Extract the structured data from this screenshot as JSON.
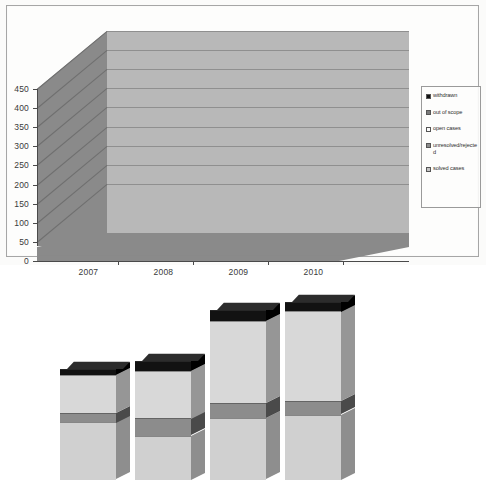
{
  "chart_data": {
    "type": "bar",
    "subtype": "stacked-3d-column",
    "title": "",
    "xlabel": "",
    "ylabel": "",
    "categories": [
      "2007",
      "2008",
      "2009",
      "2010"
    ],
    "ylim": [
      0,
      450
    ],
    "yticks": [
      0,
      50,
      100,
      150,
      200,
      250,
      300,
      350,
      400,
      450
    ],
    "ytick_labels": [
      "0",
      "50",
      "100",
      "150",
      "200",
      "250",
      "300",
      "350",
      "400",
      "450"
    ],
    "grid": true,
    "legend_position": "right",
    "series": [
      {
        "name": "solved cases",
        "color": "#d0d0d0",
        "values": [
          150,
          115,
          160,
          170
        ]
      },
      {
        "name": "unresolved/rejected",
        "color": "#8c8c8c",
        "values": [
          25,
          45,
          40,
          35
        ]
      },
      {
        "name": "open cases",
        "color": "#d8d8d8",
        "values": [
          100,
          125,
          215,
          235
        ]
      },
      {
        "name": "out of scope",
        "color": "#7a7a7a",
        "values": [
          0,
          0,
          0,
          0
        ]
      },
      {
        "name": "withdrawn",
        "color": "#121212",
        "values": [
          15,
          25,
          30,
          25
        ]
      }
    ],
    "stack_tops": {
      "2007": [
        150,
        175,
        275,
        275,
        290
      ],
      "2008": [
        115,
        160,
        285,
        285,
        310
      ],
      "2009": [
        160,
        200,
        415,
        415,
        445
      ],
      "2010": [
        170,
        205,
        440,
        440,
        465
      ]
    }
  },
  "legend": {
    "items": [
      {
        "label": "withdrawn",
        "swatch": "#121212"
      },
      {
        "label": "out of scope",
        "swatch": "#7a7a7a"
      },
      {
        "label": "open cases",
        "swatch": "#fbfbfb"
      },
      {
        "label": "unresolved/rejected",
        "swatch": "#8c8c8c"
      },
      {
        "label": "solved cases",
        "swatch": "#c4c4c4"
      }
    ]
  },
  "axes": {
    "y_labels": [
      "450",
      "400",
      "350",
      "300",
      "250",
      "200",
      "150",
      "100",
      "50",
      "0"
    ],
    "x_labels": [
      "2007",
      "2008",
      "2009",
      "2010"
    ]
  },
  "colors": {
    "back_wall": "#b8b8b8",
    "side_wall": "#8a8a8a",
    "floor": "#8a8a8a",
    "gridline": "#8f8f8f",
    "axis": "#4a4a4a",
    "page": "#fdfdfc",
    "frame_border": "#a9a9a9"
  }
}
